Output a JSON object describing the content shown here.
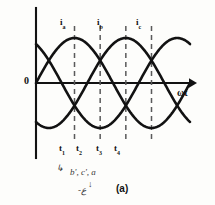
{
  "figure": {
    "caption": "(a)",
    "origin_label": "0",
    "x_axis_label": "ωt",
    "phase_labels": [
      {
        "name": "i-a",
        "text": "i",
        "sub": "a",
        "x": 60,
        "y": 18
      },
      {
        "name": "i-b",
        "text": "i",
        "sub": "b",
        "x": 97,
        "y": 18
      },
      {
        "name": "i-c",
        "text": "i",
        "sub": "c",
        "x": 136,
        "y": 18
      }
    ],
    "time_labels": [
      {
        "name": "t1",
        "text": "t",
        "sub": "1",
        "x": 59,
        "y": 144
      },
      {
        "name": "t2",
        "text": "t",
        "sub": "2",
        "x": 76,
        "y": 144
      },
      {
        "name": "t3",
        "text": "t",
        "sub": "3",
        "x": 96,
        "y": 144
      },
      {
        "name": "t4",
        "text": "t",
        "sub": "4",
        "x": 114,
        "y": 144
      }
    ],
    "handwritten_notes": [
      {
        "name": "note-phases",
        "text": "b', c', a",
        "x": 70,
        "y": 168
      },
      {
        "name": "note-arrow-mark",
        "text": "↳",
        "x": 56,
        "y": 164
      },
      {
        "name": "note-down-arrow",
        "text": "↓",
        "x": 88,
        "y": 180
      },
      {
        "name": "note-scribble",
        "text": "-ع",
        "x": 78,
        "y": 186
      }
    ],
    "colors": {
      "ink": "#121212",
      "dashed": "#5a5a5a",
      "paper": "#fdfdfb"
    }
  },
  "chart_data": {
    "type": "line",
    "title": "",
    "subtitle": "",
    "xlabel": "ωt",
    "ylabel": "",
    "grid": false,
    "legend_position": "above-curves",
    "xlim": [
      0,
      360
    ],
    "ylim": [
      -1.15,
      1.15
    ],
    "amplitude": 1.0,
    "phase_offsets_deg": [
      0,
      -120,
      -240
    ],
    "annotations": {
      "dashed_verticals_deg": [
        90,
        150,
        210,
        270
      ],
      "dashed_vertical_labels": [
        "t₁",
        "t₂",
        "t₃",
        "t₄"
      ],
      "origin_marker": "0"
    },
    "series": [
      {
        "name": "i_a",
        "label": "i_a",
        "phase_deg": 0,
        "x": [
          0,
          15,
          30,
          45,
          60,
          75,
          90,
          105,
          120,
          135,
          150,
          165,
          180,
          195,
          210,
          225,
          240,
          255,
          270,
          285,
          300,
          315,
          330,
          345,
          360
        ],
        "values": [
          0.0,
          0.259,
          0.5,
          0.707,
          0.866,
          0.966,
          1.0,
          0.966,
          0.866,
          0.707,
          0.5,
          0.259,
          0.0,
          -0.259,
          -0.5,
          -0.707,
          -0.866,
          -0.966,
          -1.0,
          -0.966,
          -0.866,
          -0.707,
          -0.5,
          -0.259,
          0.0
        ]
      },
      {
        "name": "i_b",
        "label": "i_b",
        "phase_deg": -120,
        "x": [
          0,
          15,
          30,
          45,
          60,
          75,
          90,
          105,
          120,
          135,
          150,
          165,
          180,
          195,
          210,
          225,
          240,
          255,
          270,
          285,
          300,
          315,
          330,
          345,
          360
        ],
        "values": [
          -0.866,
          -0.966,
          -1.0,
          -0.966,
          -0.866,
          -0.707,
          -0.5,
          -0.259,
          0.0,
          0.259,
          0.5,
          0.707,
          0.866,
          0.966,
          1.0,
          0.966,
          0.866,
          0.707,
          0.5,
          0.259,
          0.0,
          -0.259,
          -0.5,
          -0.707,
          -0.866
        ]
      },
      {
        "name": "i_c",
        "label": "i_c",
        "phase_deg": -240,
        "x": [
          0,
          15,
          30,
          45,
          60,
          75,
          90,
          105,
          120,
          135,
          150,
          165,
          180,
          195,
          210,
          225,
          240,
          255,
          270,
          285,
          300,
          315,
          330,
          345,
          360
        ],
        "values": [
          0.866,
          0.707,
          0.5,
          0.259,
          0.0,
          -0.259,
          -0.5,
          -0.707,
          -0.866,
          -0.966,
          -1.0,
          -0.966,
          -0.866,
          -0.707,
          -0.5,
          -0.259,
          0.0,
          0.259,
          0.5,
          0.707,
          0.866,
          0.966,
          1.0,
          0.966,
          0.866
        ]
      }
    ]
  }
}
